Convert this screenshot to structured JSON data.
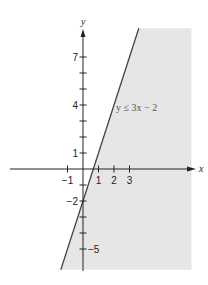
{
  "chart_data": {
    "type": "area",
    "title": "",
    "inequality": {
      "label": "y ≤ 3x − 2",
      "slope": 3,
      "intercept": -2,
      "relation": "<=",
      "shaded_side": "below-right"
    },
    "xlabel": "x",
    "ylabel": "y",
    "xlim": [
      -4.8,
      7
    ],
    "ylim": [
      -6.3,
      8.8
    ],
    "x_ticks": [
      {
        "value": -1,
        "label": "−1"
      },
      {
        "value": 1,
        "label": "1"
      },
      {
        "value": 2,
        "label": "2"
      },
      {
        "value": 3,
        "label": "3"
      }
    ],
    "y_ticks": [
      {
        "value": 7,
        "label": "7"
      },
      {
        "value": 6,
        "label": ""
      },
      {
        "value": 5,
        "label": ""
      },
      {
        "value": 4,
        "label": "4"
      },
      {
        "value": 3,
        "label": ""
      },
      {
        "value": 2,
        "label": ""
      },
      {
        "value": 1,
        "label": "1"
      },
      {
        "value": -1,
        "label": ""
      },
      {
        "value": -2,
        "label": "−2"
      },
      {
        "value": -3,
        "label": ""
      },
      {
        "value": -4,
        "label": ""
      },
      {
        "value": -5,
        "label": "−5"
      }
    ],
    "shade_region": {
      "x_max": 7,
      "y_min": -6.3,
      "y_max": 8.8
    },
    "grid": false,
    "colors": {
      "shade": "#e6e6e6",
      "line": "#444444",
      "axis": "#222222"
    }
  }
}
